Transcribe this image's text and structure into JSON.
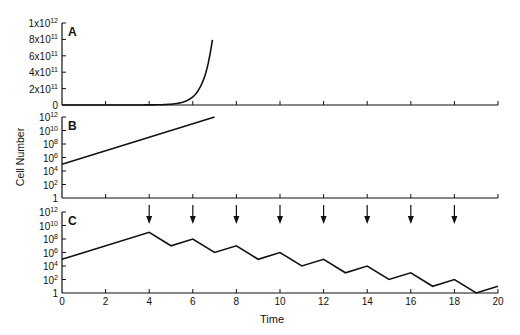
{
  "chart_data": [
    {
      "panel": "A",
      "type": "line",
      "title": "",
      "xlabel": "",
      "ylabel": "",
      "y_scale": "linear",
      "ylim": [
        0,
        1000000000000.0
      ],
      "xlim": [
        0,
        20
      ],
      "y_tick_labels": [
        "0",
        "2x10^11",
        "4x10^11",
        "6x10^11",
        "8x10^11",
        "1x10^12"
      ],
      "x_ticks": [
        0,
        2,
        4,
        6,
        8,
        10,
        12,
        14,
        16,
        18,
        20
      ],
      "x": [
        0,
        1,
        2,
        3,
        4,
        5,
        5.5,
        6,
        6.25,
        6.5,
        6.75,
        6.9
      ],
      "values": [
        100000.0,
        1000000.0,
        10000000.0,
        100000000.0,
        1000000000.0,
        10000000000.0,
        32000000000.0,
        100000000000.0,
        180000000000.0,
        320000000000.0,
        560000000000.0,
        1000000000000.0
      ],
      "grid": false
    },
    {
      "panel": "B",
      "type": "line",
      "xlabel": "",
      "ylabel": "Cell Number",
      "y_scale": "log",
      "ylim": [
        1,
        1000000000000.0
      ],
      "xlim": [
        0,
        20
      ],
      "y_tick_labels": [
        "1",
        "10^2",
        "10^4",
        "10^6",
        "10^8",
        "10^10",
        "10^12"
      ],
      "x_ticks": [
        0,
        2,
        4,
        6,
        8,
        10,
        12,
        14,
        16,
        18,
        20
      ],
      "x": [
        0,
        7
      ],
      "values": [
        100000.0,
        1000000000000.0
      ],
      "grid": false
    },
    {
      "panel": "C",
      "type": "line",
      "xlabel": "Time",
      "ylabel": "",
      "y_scale": "log",
      "ylim": [
        1,
        1000000000000.0
      ],
      "xlim": [
        0,
        20
      ],
      "y_tick_labels": [
        "1",
        "10^2",
        "10^4",
        "10^6",
        "10^8",
        "10^10",
        "10^12"
      ],
      "x_ticks": [
        0,
        2,
        4,
        6,
        8,
        10,
        12,
        14,
        16,
        18,
        20
      ],
      "x_tick_labels": [
        "0",
        "2",
        "4",
        "6",
        "8",
        "10",
        "12",
        "14",
        "16",
        "18",
        "20"
      ],
      "x": [
        0,
        4,
        5,
        6,
        7,
        8,
        9,
        10,
        11,
        12,
        13,
        14,
        15,
        16,
        17,
        18,
        19,
        20
      ],
      "values": [
        100000.0,
        1000000000.0,
        10000000.0,
        100000000.0,
        1000000.0,
        10000000.0,
        100000.0,
        1000000.0,
        10000.0,
        100000.0,
        1000.0,
        10000.0,
        100.0,
        1000.0,
        10.0,
        100.0,
        1,
        10.0
      ],
      "annotations": {
        "arrows_at_x": [
          4,
          6,
          8,
          10,
          12,
          14,
          16,
          18
        ],
        "meaning": "treatment doses (downward arrows)"
      },
      "grid": false
    }
  ],
  "labels": {
    "panel_a": "A",
    "panel_b": "B",
    "panel_c": "C",
    "y_axis_label": "Cell Number",
    "x_axis_label": "Time"
  }
}
